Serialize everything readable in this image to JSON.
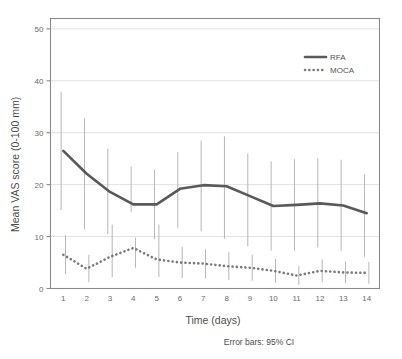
{
  "figure": {
    "caption": "Error bars: 95% CI",
    "frame_color": "#8a8a8a",
    "grid_color": "#d9d9d9",
    "background": "#ffffff"
  },
  "chart_data": {
    "type": "line",
    "title": "",
    "xlabel": "Time (days)",
    "ylabel": "Mean VAS score (0-100 mm)",
    "x": [
      1,
      2,
      3,
      4,
      5,
      6,
      7,
      8,
      9,
      10,
      11,
      12,
      13,
      14
    ],
    "xtick_labels": [
      "1",
      "2",
      "3",
      "4",
      "5",
      "6",
      "7",
      "8",
      "9",
      "10",
      "11",
      "12",
      "13",
      "14"
    ],
    "ytick_labels": [
      "0",
      "10",
      "20",
      "30",
      "40",
      "50"
    ],
    "yticks": [
      0,
      10,
      20,
      30,
      40,
      50
    ],
    "xlim": [
      0.45,
      14.55
    ],
    "ylim": [
      0,
      52
    ],
    "grid": "horizontal",
    "legend_position": "top-right",
    "errorbar_type": "95% CI",
    "series": [
      {
        "name": "RFA",
        "style": "solid",
        "color": "#595959",
        "width": 2.6,
        "values": [
          26.5,
          22.1,
          18.6,
          16.2,
          16.2,
          19.2,
          19.9,
          19.7,
          17.8,
          15.9,
          16.1,
          16.4,
          16.0,
          14.5
        ],
        "ci_lower": [
          15.1,
          11.4,
          10.5,
          14.7,
          9.5,
          11.7,
          11.0,
          9.6,
          8.1,
          7.3,
          7.3,
          7.9,
          7.2,
          6.1
        ],
        "ci_upper": [
          37.9,
          32.8,
          26.9,
          23.5,
          22.9,
          26.3,
          28.5,
          29.3,
          26.0,
          24.5,
          24.9,
          25.1,
          24.8,
          22.0
        ]
      },
      {
        "name": "MOCA",
        "style": "dotted",
        "color": "#7a7a7a",
        "width": 2.6,
        "values": [
          6.5,
          3.8,
          6.1,
          7.8,
          5.6,
          5.0,
          4.8,
          4.3,
          4.0,
          3.4,
          2.5,
          3.4,
          3.1,
          3.0
        ],
        "ci_lower": [
          2.8,
          1.2,
          2.2,
          4.0,
          2.2,
          2.0,
          1.9,
          1.6,
          1.5,
          1.1,
          0.7,
          1.2,
          1.0,
          0.9
        ],
        "ci_upper": [
          10.3,
          6.5,
          12.3,
          9.8,
          12.3,
          8.0,
          7.6,
          7.0,
          6.5,
          5.7,
          4.3,
          5.6,
          5.2,
          5.1
        ]
      }
    ]
  }
}
